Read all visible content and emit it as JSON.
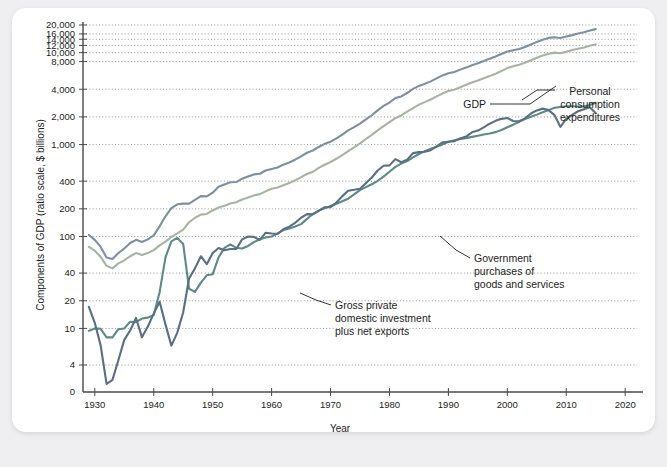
{
  "figure": {
    "background_color": "#efeff1",
    "card_color": "#ffffff",
    "axis_color": "#4a4a4a",
    "grid_color": "#8a8a8a"
  },
  "chart_data": {
    "type": "line",
    "title": "",
    "xlabel": "Year",
    "ylabel": "Components of GDP (ratio scale, $ billions)",
    "scale": "log",
    "grid": true,
    "legend_position": "inline-annotations",
    "xlim": [
      1928,
      2022
    ],
    "ylim": [
      4,
      22000
    ],
    "xticks": [
      1930,
      1940,
      1950,
      1960,
      1970,
      1980,
      1990,
      2000,
      2010,
      2020
    ],
    "xtick_labels": [
      "1930",
      "1940",
      "1950",
      "1960",
      "1970",
      "1980",
      "1990",
      "2000",
      "2010",
      "2020"
    ],
    "yticks": [
      4,
      10,
      20,
      40,
      100,
      200,
      400,
      1000,
      2000,
      4000,
      8000,
      10000,
      12000,
      14000,
      16000,
      20000
    ],
    "ytick_labels": [
      "4",
      "10",
      "20",
      "40",
      "100",
      "200",
      "400",
      "1,000",
      "2,000",
      "4,000",
      "8,000",
      "10,000",
      "12,000",
      "14,000",
      "16,000",
      "20,000"
    ],
    "ytick_zero_label": "0",
    "series": [
      {
        "name": "GDP",
        "color": "#7d8fa0",
        "x": [
          1929,
          1930,
          1931,
          1932,
          1933,
          1934,
          1935,
          1936,
          1937,
          1938,
          1939,
          1940,
          1941,
          1942,
          1943,
          1944,
          1945,
          1946,
          1947,
          1948,
          1949,
          1950,
          1951,
          1952,
          1953,
          1954,
          1955,
          1956,
          1957,
          1958,
          1959,
          1960,
          1961,
          1962,
          1963,
          1964,
          1965,
          1966,
          1967,
          1968,
          1969,
          1970,
          1971,
          1972,
          1973,
          1974,
          1975,
          1976,
          1977,
          1978,
          1979,
          1980,
          1981,
          1982,
          1983,
          1984,
          1985,
          1986,
          1987,
          1988,
          1989,
          1990,
          1991,
          1992,
          1993,
          1994,
          1995,
          1996,
          1997,
          1998,
          1999,
          2000,
          2001,
          2002,
          2003,
          2004,
          2005,
          2006,
          2007,
          2008,
          2009,
          2010,
          2011,
          2012,
          2013,
          2014,
          2015
        ],
        "values": [
          104,
          92,
          77,
          59,
          57,
          66,
          74,
          85,
          92,
          87,
          93,
          103,
          129,
          166,
          203,
          224,
          228,
          228,
          250,
          275,
          273,
          300,
          347,
          367,
          389,
          391,
          426,
          450,
          474,
          482,
          522,
          543,
          563,
          605,
          638,
          685,
          743,
          815,
          862,
          942,
          1020,
          1076,
          1168,
          1282,
          1429,
          1549,
          1689,
          1878,
          2086,
          2357,
          2632,
          2863,
          3211,
          3345,
          3638,
          4041,
          4347,
          4590,
          4870,
          5253,
          5658,
          5980,
          6174,
          6539,
          6879,
          7309,
          7664,
          8100,
          8609,
          9089,
          9661,
          10285,
          10622,
          10978,
          11511,
          12275,
          13094,
          13856,
          14478,
          14719,
          14419,
          14964,
          15518,
          16155,
          16692,
          17393,
          18037
        ]
      },
      {
        "name": "Personal consumption expenditures",
        "color": "#a6b5a2",
        "x": [
          1929,
          1930,
          1931,
          1932,
          1933,
          1934,
          1935,
          1936,
          1937,
          1938,
          1939,
          1940,
          1941,
          1942,
          1943,
          1944,
          1945,
          1946,
          1947,
          1948,
          1949,
          1950,
          1951,
          1952,
          1953,
          1954,
          1955,
          1956,
          1957,
          1958,
          1959,
          1960,
          1961,
          1962,
          1963,
          1964,
          1965,
          1966,
          1967,
          1968,
          1969,
          1970,
          1971,
          1972,
          1973,
          1974,
          1975,
          1976,
          1977,
          1978,
          1979,
          1980,
          1981,
          1982,
          1983,
          1984,
          1985,
          1986,
          1987,
          1988,
          1989,
          1990,
          1991,
          1992,
          1993,
          1994,
          1995,
          1996,
          1997,
          1998,
          1999,
          2000,
          2001,
          2002,
          2003,
          2004,
          2005,
          2006,
          2007,
          2008,
          2009,
          2010,
          2011,
          2012,
          2013,
          2014,
          2015
        ],
        "values": [
          77,
          70,
          60,
          48,
          45,
          51,
          55,
          61,
          66,
          63,
          66,
          71,
          80,
          88,
          99,
          108,
          119,
          143,
          160,
          173,
          176,
          192,
          207,
          216,
          229,
          236,
          253,
          266,
          280,
          289,
          310,
          330,
          341,
          361,
          381,
          409,
          443,
          479,
          506,
          557,
          604,
          647,
          701,
          770,
          851,
          932,
          1032,
          1150,
          1277,
          1427,
          1591,
          1755,
          1938,
          2073,
          2286,
          2498,
          2722,
          2898,
          3092,
          3346,
          3592,
          3825,
          3960,
          4215,
          4471,
          4741,
          4984,
          5268,
          5560,
          5903,
          6307,
          6792,
          7103,
          7385,
          7764,
          8260,
          8794,
          9304,
          9750,
          10014,
          9847,
          10202,
          10689,
          11051,
          11361,
          11863,
          12284
        ]
      },
      {
        "name": "Government purchases of goods and services",
        "color": "#5c8a86",
        "x": [
          1929,
          1930,
          1931,
          1932,
          1933,
          1934,
          1935,
          1936,
          1937,
          1938,
          1939,
          1940,
          1941,
          1942,
          1943,
          1944,
          1945,
          1946,
          1947,
          1948,
          1949,
          1950,
          1951,
          1952,
          1953,
          1954,
          1955,
          1956,
          1957,
          1958,
          1959,
          1960,
          1961,
          1962,
          1963,
          1964,
          1965,
          1966,
          1967,
          1968,
          1969,
          1970,
          1971,
          1972,
          1973,
          1974,
          1975,
          1976,
          1977,
          1978,
          1979,
          1980,
          1981,
          1982,
          1983,
          1984,
          1985,
          1986,
          1987,
          1988,
          1989,
          1990,
          1991,
          1992,
          1993,
          1994,
          1995,
          1996,
          1997,
          1998,
          1999,
          2000,
          2001,
          2002,
          2003,
          2004,
          2005,
          2006,
          2007,
          2008,
          2009,
          2010,
          2011,
          2012,
          2013,
          2014,
          2015
        ],
        "values": [
          9.4,
          10.0,
          9.9,
          8.0,
          8.0,
          9.8,
          10.0,
          11.8,
          11.7,
          12.8,
          13.1,
          14.0,
          24.8,
          59.6,
          88.6,
          96.5,
          83.0,
          27.0,
          25.0,
          31.5,
          37.8,
          38.8,
          59.2,
          75.3,
          82.0,
          75.3,
          74.2,
          79.0,
          86.8,
          93.4,
          97.7,
          100.0,
          107.4,
          117.6,
          122.5,
          128.3,
          136.3,
          155.6,
          175.6,
          191.5,
          202.3,
          214.4,
          226.8,
          241.8,
          258.0,
          287.5,
          319.4,
          344.1,
          369.6,
          403.6,
          448.5,
          507.2,
          572.7,
          621.4,
          661.2,
          726.9,
          790.6,
          849.2,
          899.4,
          945.1,
          1001.6,
          1073.1,
          1117.0,
          1153.4,
          1176.6,
          1212.5,
          1249.5,
          1285.7,
          1322.9,
          1366.6,
          1443.6,
          1541.6,
          1646.9,
          1769.9,
          1892.4,
          2007.5,
          2118.3,
          2244.1,
          2371.9,
          2514.3,
          2566.1,
          2612.4,
          2615.1,
          2595.0,
          2600.4,
          2694.5,
          2851.0
        ]
      },
      {
        "name": "Gross private domestic investment plus net exports",
        "color": "#5a6f86",
        "x": [
          1929,
          1930,
          1931,
          1932,
          1933,
          1934,
          1935,
          1936,
          1937,
          1938,
          1939,
          1940,
          1941,
          1942,
          1943,
          1944,
          1945,
          1946,
          1947,
          1948,
          1949,
          1950,
          1951,
          1952,
          1953,
          1954,
          1955,
          1956,
          1957,
          1958,
          1959,
          1960,
          1961,
          1962,
          1963,
          1964,
          1965,
          1966,
          1967,
          1968,
          1969,
          1970,
          1971,
          1972,
          1973,
          1974,
          1975,
          1976,
          1977,
          1978,
          1979,
          1980,
          1981,
          1982,
          1983,
          1984,
          1985,
          1986,
          1987,
          1988,
          1989,
          1990,
          1991,
          1992,
          1993,
          1994,
          1995,
          1996,
          1997,
          1998,
          1999,
          2000,
          2001,
          2002,
          2003,
          2004,
          2005,
          2006,
          2007,
          2008,
          2009,
          2010,
          2011,
          2012,
          2013,
          2014,
          2015
        ],
        "values": [
          17.2,
          11.5,
          6.5,
          1.2,
          1.8,
          4.5,
          7.5,
          9.5,
          13.0,
          8.0,
          10.5,
          14.5,
          19.5,
          11.0,
          6.5,
          9.0,
          15.0,
          35.0,
          45.0,
          61.0,
          50.0,
          66.0,
          75.0,
          71.0,
          73.0,
          73.0,
          93.0,
          100.0,
          99.0,
          92.0,
          110.0,
          108.0,
          107.0,
          120.0,
          128.0,
          141.0,
          160.0,
          175.0,
          174.0,
          190.0,
          208.0,
          209.0,
          234.0,
          275.0,
          315.0,
          322.0,
          331.0,
          380.0,
          438.0,
          523.0,
          588.0,
          594.0,
          695.0,
          642.0,
          684.0,
          808.0,
          828.0,
          836.0,
          870.0,
          955.0,
          1056.0,
          1073.0,
          1090.0,
          1164.0,
          1223.0,
          1360.0,
          1421.0,
          1539.0,
          1687.0,
          1812.0,
          1906.0,
          1946.0,
          1804.0,
          1796.0,
          1929.0,
          2176.0,
          2355.0,
          2462.0,
          2372.0,
          2094.0,
          1558.0,
          1902.0,
          2109.0,
          2306.0,
          2420.0,
          2545.0,
          2190.0
        ]
      }
    ],
    "annotations": [
      {
        "id": "gdp",
        "label": "GDP",
        "lines": [
          "GDP"
        ]
      },
      {
        "id": "pce",
        "label": "Personal consumption expenditures",
        "lines": [
          "Personal",
          "consumption",
          "expenditures"
        ]
      },
      {
        "id": "gov",
        "label": "Government purchases of goods and services",
        "lines": [
          "Government",
          "purchases of",
          "goods and services"
        ]
      },
      {
        "id": "inv",
        "label": "Gross private domestic investment plus net exports",
        "lines": [
          "Gross private",
          "domestic investment",
          "plus net exports"
        ]
      }
    ]
  }
}
